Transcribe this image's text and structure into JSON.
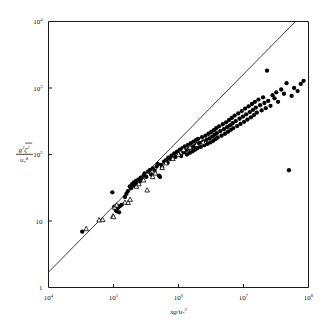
{
  "figure": {
    "background_color": "#ffffff",
    "foreground_color": "#000000"
  },
  "axes": {
    "x": {
      "label": "xg/u",
      "label_sub": "*",
      "label_exp": "2",
      "scale": "log",
      "range": [
        10000,
        100000000
      ],
      "ticks": [
        {
          "value": 10000,
          "mantissa": "10",
          "exponent": "4"
        },
        {
          "value": 100000,
          "mantissa": "10",
          "exponent": "5"
        },
        {
          "value": 1000000,
          "mantissa": "10",
          "exponent": "6"
        },
        {
          "value": 10000000,
          "mantissa": "10",
          "exponent": "7"
        },
        {
          "value": 100000000,
          "mantissa": "10",
          "exponent": "8"
        }
      ]
    },
    "y": {
      "label_numerator": "g",
      "label_numerator_exp": "2",
      "label_numerator_var": "ζ",
      "label_numerator_var_exp": "2",
      "label_denominator": "u",
      "label_denominator_sub": "*",
      "label_denominator_exp": "4",
      "scale": "log",
      "range": [
        1,
        10000
      ],
      "ticks": [
        {
          "value": 10000,
          "mantissa": "10",
          "exponent": "4"
        },
        {
          "value": 1000,
          "mantissa": "10",
          "exponent": "3"
        },
        {
          "value": 100,
          "mantissa": "10",
          "exponent": "2"
        },
        {
          "value": 10,
          "mantissa": "10",
          "exponent": ""
        },
        {
          "value": 1,
          "mantissa": "1",
          "exponent": ""
        }
      ]
    }
  },
  "chart_data": {
    "type": "scatter",
    "title": "",
    "xlabel": "xg/u*2",
    "ylabel": "g2 ζ2 / u*4",
    "xscale": "log",
    "yscale": "log",
    "xlim": [
      10000,
      100000000
    ],
    "ylim": [
      1,
      10000
    ],
    "grid": false,
    "legend": "none",
    "series": [
      {
        "name": "filled-circles",
        "marker": "filled-circle",
        "color": "#000000",
        "points": [
          [
            33000,
            6.9
          ],
          [
            96000,
            27.0
          ],
          [
            103000,
            16.5
          ],
          [
            108000,
            14.6
          ],
          [
            112000,
            14.0
          ],
          [
            118000,
            15.8
          ],
          [
            122000,
            13.5
          ],
          [
            126000,
            16.8
          ],
          [
            134000,
            17.5
          ],
          [
            150000,
            23.0
          ],
          [
            158000,
            25.5
          ],
          [
            166000,
            28.0
          ],
          [
            178000,
            33.0
          ],
          [
            186000,
            31.0
          ],
          [
            194000,
            36.0
          ],
          [
            200000,
            34.0
          ],
          [
            206000,
            38.0
          ],
          [
            214000,
            35.0
          ],
          [
            222000,
            40.0
          ],
          [
            232000,
            37.0
          ],
          [
            240000,
            42.0
          ],
          [
            252000,
            39.0
          ],
          [
            262000,
            45.0
          ],
          [
            276000,
            43.0
          ],
          [
            290000,
            48.0
          ],
          [
            300000,
            52.0
          ],
          [
            320000,
            46.0
          ],
          [
            340000,
            55.0
          ],
          [
            360000,
            58.0
          ],
          [
            380000,
            50.0
          ],
          [
            400000,
            62.0
          ],
          [
            430000,
            57.0
          ],
          [
            460000,
            66.0
          ],
          [
            480000,
            72.0
          ],
          [
            500000,
            48.0
          ],
          [
            520000,
            46.0
          ],
          [
            540000,
            70.0
          ],
          [
            560000,
            64.0
          ],
          [
            600000,
            78.0
          ],
          [
            640000,
            82.0
          ],
          [
            680000,
            75.0
          ],
          [
            700000,
            90.0
          ],
          [
            740000,
            85.0
          ],
          [
            780000,
            96.0
          ],
          [
            820000,
            88.0
          ],
          [
            860000,
            104.0
          ],
          [
            900000,
            92.0
          ],
          [
            950000,
            110.0
          ],
          [
            1000000,
            102.0
          ],
          [
            1050000,
            118.0
          ],
          [
            1100000,
            95.0
          ],
          [
            1150000,
            125.0
          ],
          [
            1200000,
            108.0
          ],
          [
            1250000,
            132.0
          ],
          [
            1300000,
            115.0
          ],
          [
            1350000,
            100.0
          ],
          [
            1400000,
            140.0
          ],
          [
            1450000,
            122.0
          ],
          [
            1500000,
            106.0
          ],
          [
            1550000,
            148.0
          ],
          [
            1600000,
            128.0
          ],
          [
            1650000,
            112.0
          ],
          [
            1700000,
            156.0
          ],
          [
            1750000,
            134.0
          ],
          [
            1800000,
            118.0
          ],
          [
            1850000,
            164.0
          ],
          [
            1900000,
            142.0
          ],
          [
            1950000,
            124.0
          ],
          [
            2000000,
            172.0
          ],
          [
            2100000,
            150.0
          ],
          [
            2200000,
            130.0
          ],
          [
            2300000,
            182.0
          ],
          [
            2400000,
            158.0
          ],
          [
            2500000,
            138.0
          ],
          [
            2600000,
            192.0
          ],
          [
            2700000,
            166.0
          ],
          [
            2800000,
            145.0
          ],
          [
            2900000,
            205.0
          ],
          [
            3000000,
            175.0
          ],
          [
            3100000,
            152.0
          ],
          [
            3200000,
            218.0
          ],
          [
            3300000,
            186.0
          ],
          [
            3400000,
            160.0
          ],
          [
            3500000,
            232.0
          ],
          [
            3600000,
            198.0
          ],
          [
            3700000,
            170.0
          ],
          [
            3800000,
            248.0
          ],
          [
            3900000,
            210.0
          ],
          [
            4000000,
            180.0
          ],
          [
            4200000,
            265.0
          ],
          [
            4400000,
            225.0
          ],
          [
            4600000,
            192.0
          ],
          [
            4800000,
            285.0
          ],
          [
            5000000,
            240.0
          ],
          [
            5200000,
            205.0
          ],
          [
            5400000,
            305.0
          ],
          [
            5600000,
            258.0
          ],
          [
            5800000,
            220.0
          ],
          [
            6000000,
            330.0
          ],
          [
            6200000,
            275.0
          ],
          [
            6400000,
            235.0
          ],
          [
            6600000,
            355.0
          ],
          [
            6800000,
            295.0
          ],
          [
            7000000,
            250.0
          ],
          [
            7300000,
            385.0
          ],
          [
            7600000,
            318.0
          ],
          [
            8000000,
            268.0
          ],
          [
            8300000,
            415.0
          ],
          [
            8700000,
            345.0
          ],
          [
            9000000,
            288.0
          ],
          [
            9400000,
            450.0
          ],
          [
            9800000,
            372.0
          ],
          [
            10200000,
            310.0
          ],
          [
            10600000,
            490.0
          ],
          [
            11000000,
            402.0
          ],
          [
            11500000,
            335.0
          ],
          [
            12000000,
            530.0
          ],
          [
            12500000,
            435.0
          ],
          [
            13000000,
            362.0
          ],
          [
            13500000,
            575.0
          ],
          [
            14000000,
            470.0
          ],
          [
            14500000,
            392.0
          ],
          [
            15000000,
            620.0
          ],
          [
            15500000,
            508.0
          ],
          [
            16000000,
            425.0
          ],
          [
            17000000,
            670.0
          ],
          [
            18000000,
            550.0
          ],
          [
            19000000,
            460.0
          ],
          [
            20000000,
            725.0
          ],
          [
            21000000,
            595.0
          ],
          [
            22000000,
            498.0
          ],
          [
            23000000,
            1820.0
          ],
          [
            24000000,
            640.0
          ],
          [
            26000000,
            540.0
          ],
          [
            28000000,
            780.0
          ],
          [
            30000000,
            700.0
          ],
          [
            32000000,
            860.0
          ],
          [
            34000000,
            620.0
          ],
          [
            38000000,
            950.0
          ],
          [
            42000000,
            820.0
          ],
          [
            46000000,
            1180.0
          ],
          [
            50000000,
            58.0
          ],
          [
            55000000,
            760.0
          ],
          [
            60000000,
            1000.0
          ],
          [
            68000000,
            900.0
          ],
          [
            76000000,
            1150.0
          ],
          [
            84000000,
            1280.0
          ]
        ]
      },
      {
        "name": "open-triangles",
        "marker": "open-triangle",
        "color": "#000000",
        "points": [
          [
            38000,
            7.6
          ],
          [
            60000,
            10.3
          ],
          [
            68000,
            10.4
          ],
          [
            98000,
            11.8
          ],
          [
            100000,
            11.5
          ],
          [
            104000,
            16.0
          ],
          [
            112000,
            17.2
          ],
          [
            150000,
            19.0
          ],
          [
            168000,
            18.8
          ],
          [
            180000,
            21.0
          ],
          [
            225000,
            33.0
          ],
          [
            245000,
            36.0
          ],
          [
            290000,
            41.0
          ],
          [
            330000,
            29.0
          ],
          [
            400000,
            46.0
          ],
          [
            440000,
            52.0
          ],
          [
            560000,
            63.0
          ],
          [
            640000,
            74.0
          ],
          [
            820000,
            86.0
          ],
          [
            1000000,
            100.0
          ],
          [
            1200000,
            118.0
          ],
          [
            1500000,
            128.0
          ],
          [
            1900000,
            140.0
          ],
          [
            2400000,
            152.0
          ]
        ]
      }
    ],
    "reference_line": {
      "name": "diagonal-reference-line",
      "x_start": 10000,
      "y_start": 1.7,
      "x_end": 63000000,
      "y_end": 10000
    }
  }
}
